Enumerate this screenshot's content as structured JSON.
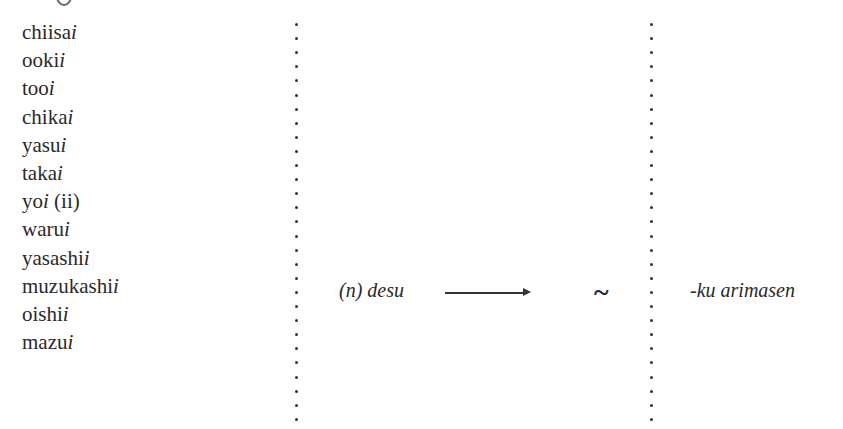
{
  "adjectives": [
    {
      "stem": "chiisa",
      "ending": "i",
      "note": ""
    },
    {
      "stem": "ooki",
      "ending": "i",
      "note": ""
    },
    {
      "stem": "too",
      "ending": "i",
      "note": ""
    },
    {
      "stem": "chika",
      "ending": "i",
      "note": ""
    },
    {
      "stem": "yasu",
      "ending": "i",
      "note": ""
    },
    {
      "stem": "taka",
      "ending": "i",
      "note": ""
    },
    {
      "stem": "yo",
      "ending": "i",
      "note": " (ii)"
    },
    {
      "stem": "waru",
      "ending": "i",
      "note": ""
    },
    {
      "stem": "yasashi",
      "ending": "i",
      "note": ""
    },
    {
      "stem": "muzukashi",
      "ending": "i",
      "note": ""
    },
    {
      "stem": "oishi",
      "ending": "i",
      "note": ""
    },
    {
      "stem": "mazu",
      "ending": "i",
      "note": ""
    }
  ],
  "middle": {
    "label": "(n) desu",
    "arrow": "arrow-right",
    "replacement": "~"
  },
  "right": {
    "label": "-ku arimasen"
  },
  "colors": {
    "text": "#2a2a2a",
    "background": "#ffffff"
  }
}
